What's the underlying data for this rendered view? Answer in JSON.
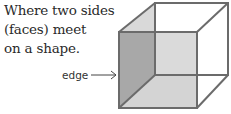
{
  "caption": {
    "lines": [
      "Where two sides",
      "(faces) meet",
      "on a shape."
    ]
  },
  "diagram": {
    "label": "edge",
    "arrow": "right-arrow",
    "shape": "cube",
    "colors": {
      "edge_stroke": "#6e6e6e",
      "left_face": "#a9a9a9",
      "bottom_face": "#d6d6d6",
      "front_face": "#d9d9d9",
      "top_left_face": "#d9d9d9"
    }
  }
}
